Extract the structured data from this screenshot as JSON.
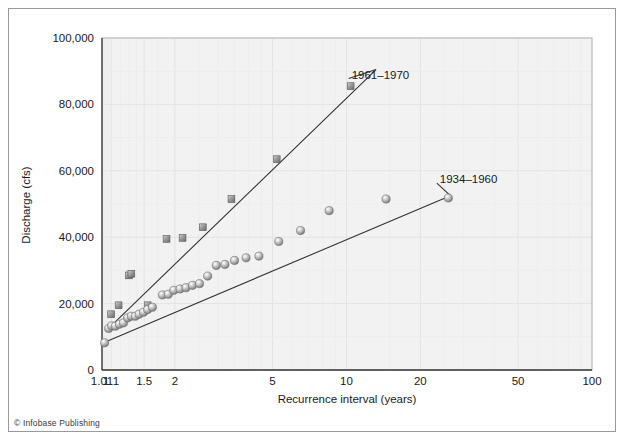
{
  "credit": "© Infobase Publishing",
  "chart_data": {
    "type": "scatter",
    "title": "",
    "xlabel": "Recurrence interval (years)",
    "ylabel": "Discharge (cfs)",
    "xscale": "log",
    "xlim": [
      1.01,
      100
    ],
    "ylim": [
      0,
      100000
    ],
    "grid": true,
    "legend_position": "inline-right",
    "xticks": [
      "1.01",
      "1.1",
      "1.5",
      "2",
      "5",
      "10",
      "20",
      "50",
      "100"
    ],
    "xtick_values": [
      1.01,
      1.1,
      1.5,
      2,
      5,
      10,
      20,
      50,
      100
    ],
    "yticks": [
      "0",
      "20,000",
      "40,000",
      "60,000",
      "80,000",
      "100,000"
    ],
    "ytick_values": [
      0,
      20000,
      40000,
      60000,
      80000,
      100000
    ],
    "series": [
      {
        "name": "1961–1970",
        "marker": "square",
        "marker_color": "#8c8c8c",
        "label_x": 10.5,
        "label_y": 89000,
        "trend_line": {
          "x0": 1.09,
          "y0": 13000,
          "x1": 13.2,
          "y1": 90500
        },
        "points": [
          {
            "x": 1.1,
            "y": 16800
          },
          {
            "x": 1.18,
            "y": 19500
          },
          {
            "x": 1.3,
            "y": 28500
          },
          {
            "x": 1.33,
            "y": 29000
          },
          {
            "x": 1.55,
            "y": 19500
          },
          {
            "x": 1.85,
            "y": 39500
          },
          {
            "x": 2.15,
            "y": 39800
          },
          {
            "x": 2.6,
            "y": 43000
          },
          {
            "x": 3.4,
            "y": 51500
          },
          {
            "x": 5.2,
            "y": 63500
          },
          {
            "x": 10.4,
            "y": 85500
          }
        ]
      },
      {
        "name": "1934–1960",
        "marker": "circle",
        "marker_color": "#a9a9a9",
        "label_x": 24.0,
        "label_y": 57500,
        "trend_line": {
          "x0": 1.03,
          "y0": 8300,
          "x1": 26.5,
          "y1": 52500
        },
        "points": [
          {
            "x": 1.035,
            "y": 8200
          },
          {
            "x": 1.075,
            "y": 12500
          },
          {
            "x": 1.105,
            "y": 13300
          },
          {
            "x": 1.145,
            "y": 13200
          },
          {
            "x": 1.19,
            "y": 13800
          },
          {
            "x": 1.235,
            "y": 14200
          },
          {
            "x": 1.285,
            "y": 15700
          },
          {
            "x": 1.33,
            "y": 16200
          },
          {
            "x": 1.38,
            "y": 16200
          },
          {
            "x": 1.43,
            "y": 16800
          },
          {
            "x": 1.49,
            "y": 17400
          },
          {
            "x": 1.55,
            "y": 18200
          },
          {
            "x": 1.62,
            "y": 18900
          },
          {
            "x": 1.78,
            "y": 22600
          },
          {
            "x": 1.88,
            "y": 22800
          },
          {
            "x": 1.98,
            "y": 24000
          },
          {
            "x": 2.1,
            "y": 24400
          },
          {
            "x": 2.22,
            "y": 24800
          },
          {
            "x": 2.36,
            "y": 25500
          },
          {
            "x": 2.52,
            "y": 26000
          },
          {
            "x": 2.72,
            "y": 28300
          },
          {
            "x": 2.95,
            "y": 31500
          },
          {
            "x": 3.2,
            "y": 31800
          },
          {
            "x": 3.5,
            "y": 33000
          },
          {
            "x": 3.9,
            "y": 33800
          },
          {
            "x": 4.4,
            "y": 34300
          },
          {
            "x": 5.3,
            "y": 38700
          },
          {
            "x": 6.5,
            "y": 42000
          },
          {
            "x": 8.5,
            "y": 48000
          },
          {
            "x": 14.5,
            "y": 51500
          },
          {
            "x": 26.0,
            "y": 51800
          }
        ]
      }
    ]
  }
}
